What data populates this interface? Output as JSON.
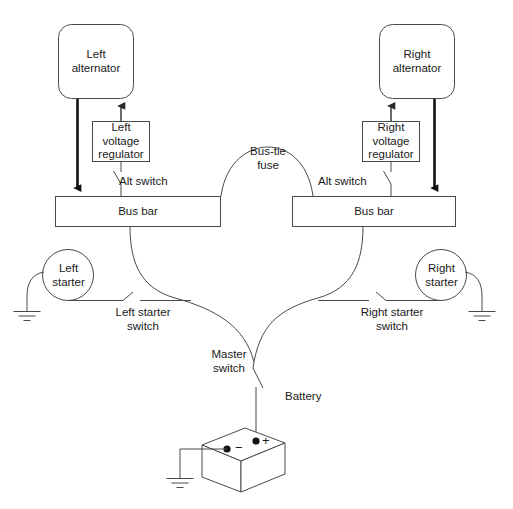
{
  "diagram": {
    "stroke_color": "#4a4a4a",
    "heavy_stroke_color": "#111111",
    "text_color": "#1a1a1a",
    "background": "#ffffff",
    "components": {
      "left_alternator": {
        "label": "Left\nalternator",
        "shape": "rounded-rect"
      },
      "right_alternator": {
        "label": "Right\nalternator",
        "shape": "rounded-rect"
      },
      "left_voltage_regulator": {
        "label": "Left\nvoltage\nregulator",
        "shape": "rect"
      },
      "right_voltage_regulator": {
        "label": "Right\nvoltage\nregulator",
        "shape": "rect"
      },
      "left_bus_bar": {
        "label": "Bus bar",
        "shape": "rect"
      },
      "right_bus_bar": {
        "label": "Bus bar",
        "shape": "rect"
      },
      "left_starter": {
        "label": "Left\nstarter",
        "shape": "circle"
      },
      "right_starter": {
        "label": "Right\nstarter",
        "shape": "circle"
      },
      "battery": {
        "label": "Battery",
        "shape": "3d-box"
      }
    },
    "labels": {
      "bus_tie_fuse": "Bus-tie\nfuse",
      "left_alt_switch": "Alt switch",
      "right_alt_switch": "Alt switch",
      "left_starter_switch": "Left starter\nswitch",
      "right_starter_switch": "Right starter\nswitch",
      "master_switch": "Master\nswitch",
      "battery": "Battery",
      "battery_positive": "+",
      "battery_negative": "−"
    }
  }
}
